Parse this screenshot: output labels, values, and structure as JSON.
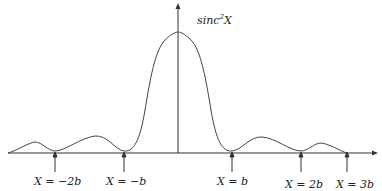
{
  "diagram": {
    "title_main": "sinc",
    "title_sup": "2",
    "title_var": "X",
    "labels": [
      {
        "text": "X = −2b",
        "x": 55
      },
      {
        "text": "X = −b",
        "x": 124
      },
      {
        "text": "X = b",
        "x": 232
      },
      {
        "text": "X = 2b",
        "x": 301
      },
      {
        "text": "X = 3b",
        "x": 347
      }
    ],
    "colors": {
      "line": "#333333",
      "text": "#222222"
    }
  }
}
